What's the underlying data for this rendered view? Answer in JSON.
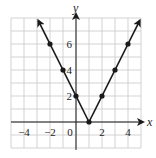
{
  "chart_data": {
    "type": "line",
    "title": "",
    "xlabel": "x",
    "ylabel": "y",
    "xlim": [
      -5,
      5
    ],
    "ylim": [
      -2,
      8
    ],
    "grid": true,
    "x_ticks": [
      "-4",
      "-2",
      "0",
      "2",
      "4"
    ],
    "y_ticks": [
      "2",
      "4",
      "6"
    ],
    "series": [
      {
        "name": "y = 2|x - 1|",
        "x": [
          -2,
          -1,
          0,
          1,
          2,
          3,
          4
        ],
        "values": [
          6,
          4,
          2,
          0,
          2,
          4,
          6
        ],
        "markers": true,
        "arrows_both_ends": true
      }
    ],
    "colors": {
      "line": "#1a1a1a",
      "grid": "#c8c8c8"
    }
  },
  "labels": {
    "x": "x",
    "y": "y",
    "xt": [
      "−4",
      "−2",
      "0",
      "2",
      "4"
    ],
    "yt": [
      "2",
      "4",
      "6"
    ]
  }
}
